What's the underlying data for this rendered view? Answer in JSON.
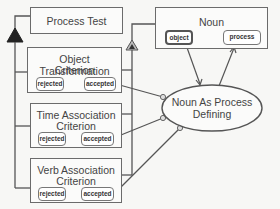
{
  "process_test": {
    "title": "Process Test"
  },
  "criteria": [
    {
      "title_line1": "Object Transformation",
      "title_line2": "Criterion",
      "rejected": "rejected",
      "accepted": "accepted"
    },
    {
      "title_line1": "Time Association",
      "title_line2": "Criterion",
      "rejected": "rejected",
      "accepted": "accepted"
    },
    {
      "title_line1": "Verb Association",
      "title_line2": "Criterion",
      "rejected": "rejected",
      "accepted": "accepted"
    }
  ],
  "noun": {
    "title": "Noun",
    "object": "object",
    "process": "process"
  },
  "ellipse": {
    "line1": "Noun As Process",
    "line2": "Defining"
  },
  "colors": {
    "line": "#555555",
    "box_border": "#6b6b6b",
    "background": "#f7f7f5"
  }
}
